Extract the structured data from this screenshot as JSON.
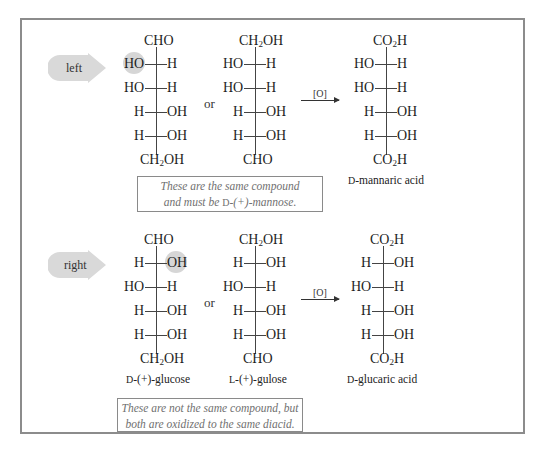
{
  "figure": {
    "sections": [
      {
        "id": "left",
        "tag": "left",
        "highlighted_group": "HO (C2, left side)",
        "structures": [
          {
            "top": "CHO",
            "rows": [
              [
                "HO",
                "H"
              ],
              [
                "HO",
                "H"
              ],
              [
                "H",
                "OH"
              ],
              [
                "H",
                "OH"
              ]
            ],
            "bottom": "CH2OH",
            "name": ""
          },
          {
            "top": "CH2OH",
            "rows": [
              [
                "HO",
                "H"
              ],
              [
                "HO",
                "H"
              ],
              [
                "H",
                "OH"
              ],
              [
                "H",
                "OH"
              ]
            ],
            "bottom": "CHO",
            "name": ""
          }
        ],
        "connector": "or",
        "reagent": "[O]",
        "product": {
          "top": "CO2H",
          "rows": [
            [
              "HO",
              "H"
            ],
            [
              "HO",
              "H"
            ],
            [
              "H",
              "OH"
            ],
            [
              "H",
              "OH"
            ]
          ],
          "bottom": "CO2H",
          "name_prefix": "D",
          "name_rest": "-mannaric acid"
        },
        "note_lines": [
          "These are the same compound",
          "and must be "
        ],
        "note_prefix": "D",
        "note_suffix": "-(+)-mannose."
      },
      {
        "id": "right",
        "tag": "right",
        "highlighted_group": "OH (C2, right side)",
        "structures": [
          {
            "top": "CHO",
            "rows": [
              [
                "H",
                "OH"
              ],
              [
                "HO",
                "H"
              ],
              [
                "H",
                "OH"
              ],
              [
                "H",
                "OH"
              ]
            ],
            "bottom": "CH2OH",
            "name_prefix": "D",
            "name_rest": "-(+)-glucose"
          },
          {
            "top": "CH2OH",
            "rows": [
              [
                "H",
                "OH"
              ],
              [
                "HO",
                "H"
              ],
              [
                "H",
                "OH"
              ],
              [
                "H",
                "OH"
              ]
            ],
            "bottom": "CHO",
            "name_prefix": "L",
            "name_rest": "-(+)-gulose"
          }
        ],
        "connector": "or",
        "reagent": "[O]",
        "product": {
          "top": "CO2H",
          "rows": [
            [
              "H",
              "OH"
            ],
            [
              "HO",
              "H"
            ],
            [
              "H",
              "OH"
            ],
            [
              "H",
              "OH"
            ]
          ],
          "bottom": "CO2H",
          "name_prefix": "D",
          "name_rest": "-glucaric acid"
        },
        "note_lines": [
          "These are not the same compound, but",
          "both are oxidized to the same diacid."
        ]
      }
    ],
    "chem": {
      "CH2": "CH",
      "sub2": "2",
      "OH_tail": "OH",
      "CO": "CO",
      "H_tail": "H"
    },
    "colors": {
      "frame": "#8c8c8c",
      "tag_fill": "#d9d9d9",
      "highlight": "#d6d6d6",
      "note_text": "#707070"
    }
  }
}
